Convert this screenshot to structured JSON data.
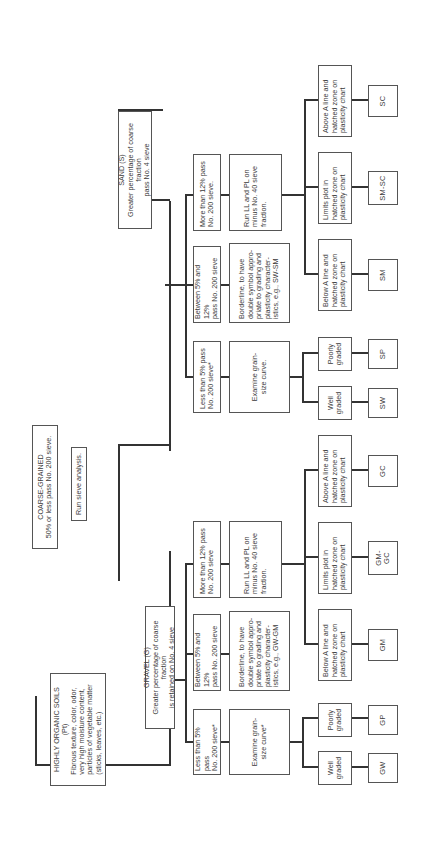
{
  "diagram": {
    "orientation": "rotated 90deg counter-clockwise",
    "root": {
      "highly_organic": {
        "title": "HIGHLY ORGANIC SOILS",
        "symbol": "(Pt)",
        "description": "Fibrous texture, color, odor,\nvery high moisture content,\nparticles of vegetable matter\n(sticks, leaves, etc.)"
      },
      "coarse_grained": {
        "title": "COARSE-GRAINED",
        "description": "50% or less pass No. 200 sieve."
      },
      "run_sieve": "Run sieve analysis."
    },
    "gravel": {
      "title": "GRAVEL (G)",
      "description": "Greater percentage of coarse fraction\nis retained on No. 4 sieve",
      "criteria": [
        "Less than 5% pass\nNo. 200 sieve*",
        "Between 5% and 12%\npass No. 200 sieve",
        "More than 12% pass\nNo. 200 sieve"
      ],
      "actions": [
        "Examine grain-\nsize curve*",
        "Borderline, to have\ndouble symbol appro-\npriate to grading and\nplasticity character-\nistics, e.g., GW-GM",
        "Run LL and PL on\nminus No. 40 sieve\nfraction."
      ],
      "grading": [
        "Well\ngraded",
        "Poorly\ngraded"
      ],
      "plasticity": [
        "Below A line and\nhatched zone on\nplasticity chart",
        "Limits plot in\nhatched zone on\nplasticity chart",
        "Above A line and\nhatched zone on\nplasticity chart"
      ],
      "symbols": [
        "GW",
        "GP",
        "GM",
        "GM-GC",
        "GC"
      ]
    },
    "sand": {
      "title": "SAND (S)",
      "description": "Greater percentage of coarse fraction\npass No. 4 sieve",
      "criteria": [
        "Less than 5% pass\nNo. 200 sieve*",
        "Between 5% and 12%\npass No. 200 sieve",
        "More than 12% pass\nNo. 200 sieve."
      ],
      "actions": [
        "Examine grain-\nsize curve.",
        "Borderline, to have\ndouble symbol appro-\npriate to grading and\nplasticity character-\nistics, e.g., SW-SM",
        "Run LL and PL on\nminus No. 40 sieve\nfraction."
      ],
      "grading": [
        "Well\ngraded",
        "Poorly\ngraded"
      ],
      "plasticity": [
        "Below A line and\nhatched zone on\nplasticity chart",
        "Limits plot in\nhatched zone on\nplasticity chart",
        "Above A line and\nhatched zone on\nplasticity chart"
      ],
      "symbols": [
        "SW",
        "SP",
        "SM",
        "SM-SC",
        "SC"
      ]
    }
  }
}
